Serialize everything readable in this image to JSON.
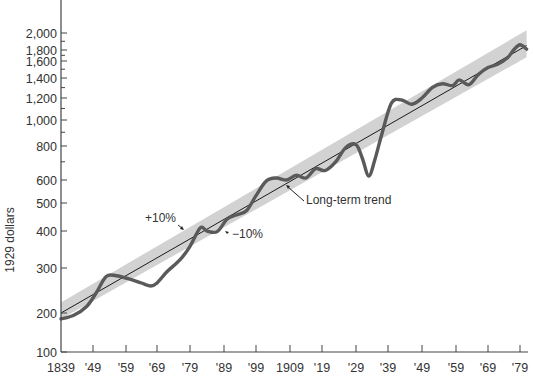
{
  "chart_data": {
    "type": "line",
    "title": "",
    "xlabel": "",
    "ylabel": "1929 dollars",
    "yscale": "log",
    "ylim": [
      100,
      2100
    ],
    "xlim": [
      1839,
      1981
    ],
    "grid": false,
    "x_ticks": [
      "1839",
      "'49",
      "'59",
      "'69",
      "'79",
      "'89",
      "'99",
      "1909",
      "'19",
      "'29",
      "'39",
      "'49",
      "'59",
      "'69",
      "'79"
    ],
    "x_tick_years": [
      1839,
      1849,
      1859,
      1869,
      1879,
      1889,
      1899,
      1909,
      1919,
      1929,
      1939,
      1949,
      1959,
      1969,
      1979
    ],
    "y_ticks": [
      "100",
      "200",
      "300",
      "400",
      "500",
      "600",
      "800",
      "1,000",
      "1,200",
      "1,400",
      "1,600",
      "1,800",
      "2,000"
    ],
    "y_tick_values": [
      100,
      200,
      300,
      400,
      500,
      600,
      800,
      1000,
      1200,
      1400,
      1600,
      1800,
      2000
    ],
    "series": [
      {
        "name": "Actual value (1929 dollars)",
        "x": [
          1839,
          1843,
          1847,
          1850,
          1853,
          1856,
          1860,
          1864,
          1867,
          1869,
          1872,
          1876,
          1879,
          1882,
          1884,
          1887,
          1890,
          1893,
          1896,
          1899,
          1902,
          1905,
          1908,
          1911,
          1914,
          1917,
          1920,
          1923,
          1926,
          1929,
          1931,
          1933,
          1935,
          1937,
          1940,
          1943,
          1946,
          1949,
          1952,
          1955,
          1958,
          1960,
          1963,
          1966,
          1969,
          1972,
          1975,
          1977,
          1979,
          1981
        ],
        "values": [
          180,
          192,
          212,
          240,
          278,
          280,
          272,
          262,
          255,
          262,
          290,
          320,
          355,
          410,
          400,
          398,
          440,
          455,
          470,
          530,
          595,
          610,
          600,
          625,
          610,
          660,
          650,
          700,
          790,
          810,
          720,
          620,
          720,
          880,
          1150,
          1180,
          1140,
          1200,
          1300,
          1340,
          1320,
          1380,
          1330,
          1440,
          1520,
          1560,
          1650,
          1800,
          1860,
          1810
        ]
      },
      {
        "name": "Long-term trend",
        "x": [
          1839,
          1981
        ],
        "values": [
          200,
          1850
        ]
      }
    ],
    "band": {
      "name": "±10% band",
      "upper_pct": 10,
      "lower_pct": -10
    },
    "annotations": [
      {
        "text": "+10%",
        "x": 1876,
        "y": 410
      },
      {
        "text": "−10%",
        "x": 1895,
        "y": 380
      },
      {
        "text": "Long-term trend",
        "x": 1917,
        "y": 540
      }
    ],
    "colors": {
      "actual": "#5a5a5a",
      "trend": "#1a1a1a",
      "band": "#d2d2d2",
      "axis": "#444444"
    }
  },
  "labels": {
    "ylabel": "1929 dollars",
    "plus10": "+10%",
    "minus10": "−10%",
    "trend": "Long-term trend"
  }
}
